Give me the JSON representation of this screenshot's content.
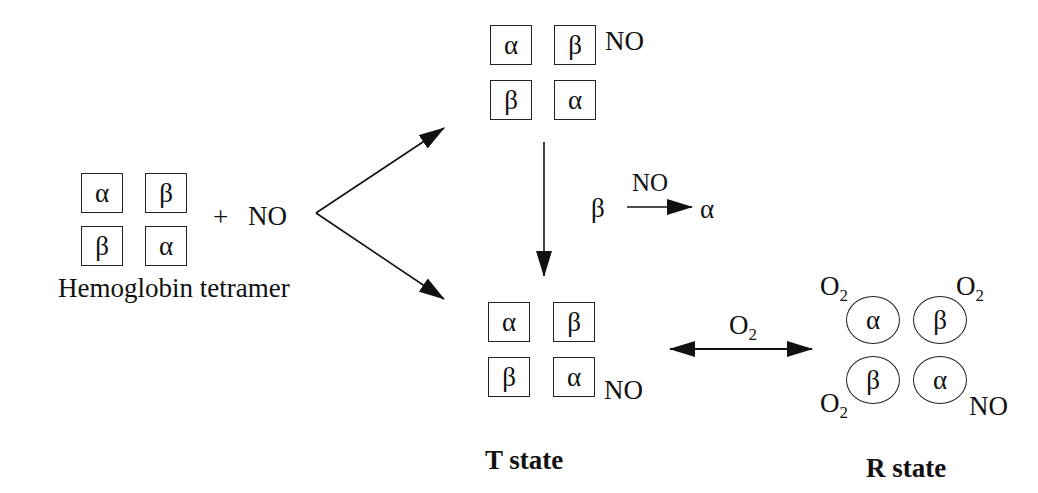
{
  "diagram": {
    "subunits": {
      "alpha": "α",
      "beta": "β"
    },
    "tetramer": {
      "grid": [
        [
          "α",
          "β"
        ],
        [
          "β",
          "α"
        ]
      ],
      "label": "Hemoglobin tetramer",
      "plus": "+",
      "reactant": "NO"
    },
    "top_complex": {
      "grid": [
        [
          "α",
          "β"
        ],
        [
          "β",
          "α"
        ]
      ],
      "ligand": "NO",
      "ligand_position": "top-right beta"
    },
    "transfer": {
      "from": "β",
      "over_arrow": "NO",
      "to": "α"
    },
    "t_state": {
      "grid": [
        [
          "α",
          "β"
        ],
        [
          "β",
          "α"
        ]
      ],
      "ligand": "NO",
      "ligand_position": "bottom-right alpha",
      "label": "T state"
    },
    "equilibrium": {
      "label_main": "O",
      "label_sub": "2"
    },
    "r_state": {
      "grid": [
        [
          "α",
          "β"
        ],
        [
          "β",
          "α"
        ]
      ],
      "ligands": [
        {
          "position": "top-left",
          "main": "O",
          "sub": "2"
        },
        {
          "position": "top-right",
          "main": "O",
          "sub": "2"
        },
        {
          "position": "bottom-left",
          "main": "O",
          "sub": "2"
        },
        {
          "position": "bottom-right",
          "main": "NO",
          "sub": ""
        }
      ],
      "label": "R state"
    }
  }
}
